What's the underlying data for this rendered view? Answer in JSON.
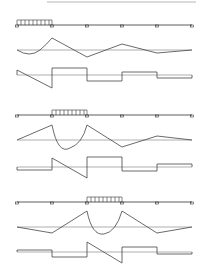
{
  "figure": {
    "colors": {
      "background": "#ffffff",
      "beam": "#333333",
      "diagram": "#444444",
      "baseline": "#9a9a9a",
      "top_rule": "#b5b5b5"
    },
    "span_count": 5,
    "supports_x": [
      17,
      52,
      87,
      122,
      157,
      192
    ],
    "cases": [
      {
        "id": "case-1",
        "loaded_span": 1,
        "beam_y": 25,
        "moment_baseline_y": 50,
        "shear_baseline_y": 75
      },
      {
        "id": "case-2",
        "loaded_span": 2,
        "beam_y": 115,
        "moment_baseline_y": 140,
        "shear_baseline_y": 167
      },
      {
        "id": "case-3",
        "loaded_span": 3,
        "beam_y": 202,
        "moment_baseline_y": 227,
        "shear_baseline_y": 252
      }
    ]
  }
}
